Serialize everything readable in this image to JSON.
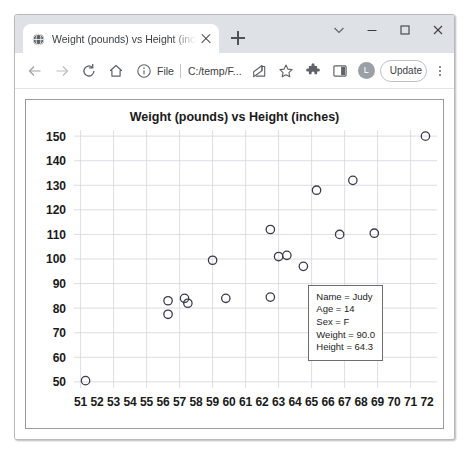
{
  "window": {
    "controls": [
      {
        "name": "minimize-to-tray-chevron",
        "glyph": "chevron-down-icon"
      },
      {
        "name": "minimize",
        "glyph": "minimize-icon"
      },
      {
        "name": "maximize",
        "glyph": "maximize-icon"
      },
      {
        "name": "close",
        "glyph": "close-icon"
      }
    ]
  },
  "tabstrip": {
    "tab": {
      "title": "Weight (pounds) vs Height (inch",
      "favicon": "globe-icon",
      "close_label": "Close tab"
    },
    "new_tab_label": "New tab"
  },
  "toolbar": {
    "back_label": "Back",
    "forward_label": "Forward",
    "reload_label": "Reload",
    "home_label": "Home",
    "omnibox": {
      "info_icon": "info-circle-icon",
      "scheme": "File",
      "url": "C:/temp/F...",
      "placeholder": "Search Google or type a URL"
    },
    "share_label": "Share",
    "bookmark_label": "Bookmark this tab",
    "extensions_label": "Extensions",
    "sidepanel_label": "Side panel",
    "profile_initial": "L",
    "update_label": "Update",
    "menu_label": "Customize and control Google Chrome"
  },
  "chart_data": {
    "type": "scatter",
    "title": "Weight (pounds) vs Height (inches)",
    "xlabel": "",
    "ylabel": "",
    "xlim": [
      50.6,
      72.6
    ],
    "ylim": [
      47.5,
      152.5
    ],
    "xticks": [
      51,
      52,
      53,
      54,
      55,
      56,
      57,
      58,
      59,
      60,
      61,
      62,
      63,
      64,
      65,
      66,
      67,
      68,
      69,
      70,
      71,
      72
    ],
    "yticks": [
      50,
      60,
      70,
      80,
      90,
      100,
      110,
      120,
      130,
      140,
      150
    ],
    "grid": true,
    "legend": "none",
    "marker": {
      "shape": "circle",
      "filled": false,
      "color": "#3b3b4f",
      "size": 4.2
    },
    "points": [
      {
        "x": 51.3,
        "y": 50.5
      },
      {
        "x": 56.3,
        "y": 83.0
      },
      {
        "x": 56.3,
        "y": 77.5
      },
      {
        "x": 57.3,
        "y": 84.0
      },
      {
        "x": 57.5,
        "y": 82.0
      },
      {
        "x": 59.0,
        "y": 99.5
      },
      {
        "x": 59.8,
        "y": 84.0
      },
      {
        "x": 62.5,
        "y": 112.0
      },
      {
        "x": 62.5,
        "y": 84.5
      },
      {
        "x": 63.0,
        "y": 101.0
      },
      {
        "x": 63.5,
        "y": 101.5
      },
      {
        "x": 64.5,
        "y": 97.0
      },
      {
        "x": 65.3,
        "y": 128.0
      },
      {
        "x": 66.7,
        "y": 110.0
      },
      {
        "x": 67.5,
        "y": 132.0
      },
      {
        "x": 68.8,
        "y": 110.5
      },
      {
        "x": 71.9,
        "y": 150.0
      }
    ]
  },
  "tooltip": {
    "lines": [
      "Name = Judy",
      "Age = 14",
      "Sex = F",
      "Weight = 90.0",
      "Height = 64.3"
    ]
  }
}
